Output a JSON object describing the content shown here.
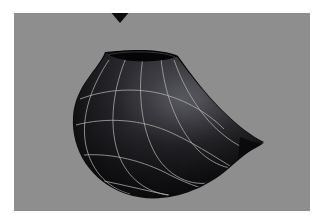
{
  "page": {
    "width": 316,
    "height": 220,
    "page_background": "#ffffff"
  },
  "viewport": {
    "name": "render-viewport",
    "x": 14,
    "y": 13,
    "width": 296,
    "height": 198,
    "background_color": "#8e8e8e"
  },
  "marker": {
    "name": "selection-marker",
    "shape": "triangle-down",
    "color": "#0d0d0d",
    "center_x": 120,
    "top_y": 10,
    "width": 22,
    "height": 13
  },
  "object": {
    "name": "parametric-surface",
    "label": "crescent-vase-surface",
    "description": "open-topped crescent shaped revolution surface with wireframe grid",
    "surface_color_dark": "#1b1b1e",
    "surface_color_mid": "#2e2e33",
    "surface_color_light": "#4a4a50",
    "silhouette_color": "#0a0a0c",
    "rim_interior_color": "#050506",
    "wireframe_color": "#b9b9b4",
    "wireframe_opacity": 0.72,
    "wireframe_width": 1.0,
    "shading": "smooth-gouraud",
    "light_direction": "upper-right",
    "rim_opening": {
      "name": "surface-rim-opening",
      "center_x": 127,
      "center_y": 52,
      "rx": 35,
      "ry": 8
    },
    "tip": {
      "name": "surface-tip",
      "x": 248,
      "y": 142
    }
  },
  "chart_data": {
    "type": "scatter",
    "title": "",
    "xlabel": "",
    "ylabel": "",
    "meridians": 6,
    "parallels": 4,
    "note": "wireframe grid lines on a surface of revolution"
  }
}
